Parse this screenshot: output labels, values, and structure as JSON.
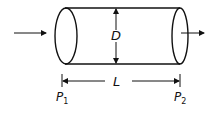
{
  "diagram": {
    "type": "pipe-flow",
    "labels": {
      "diameter": "D",
      "length": "L",
      "p1_main": "P",
      "p1_sub": "1",
      "p2_main": "P",
      "p2_sub": "2"
    },
    "colors": {
      "stroke": "#111111",
      "background": "#ffffff"
    }
  }
}
